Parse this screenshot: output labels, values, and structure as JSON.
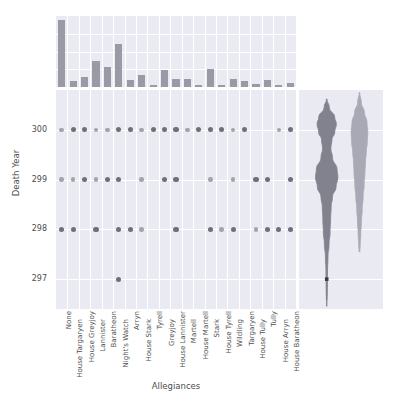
{
  "chart_data": {
    "type": "scatter",
    "title": "",
    "xlabel": "Allegiances",
    "ylabel": "Death Year",
    "grid": true,
    "legend": "none",
    "ylim": [
      296.4,
      300.8
    ],
    "yticks": [
      "300",
      "299",
      "298",
      "297"
    ],
    "ytick_values": [
      300,
      299,
      298,
      297
    ],
    "categories": [
      "None",
      "House Targaryen",
      "House Greyjoy",
      "Lannister",
      "Baratheon",
      "Night's Watch",
      "Arryn",
      "House Stark",
      "Tyrell",
      "Greyjoy",
      "House Lannister",
      "Martell",
      "House Martell",
      "Stark",
      "House Tyrell",
      "Wildling",
      "Targaryen",
      "House Tully",
      "Tully",
      "House Arryn",
      "House Baratheon"
    ],
    "marginal_bar": {
      "type": "bar",
      "ylabel": "count",
      "values": [
        66,
        6,
        10,
        26,
        20,
        42,
        7,
        12,
        2,
        17,
        8,
        8,
        2,
        18,
        2,
        8,
        6,
        3,
        7,
        2,
        4
      ],
      "ylim": [
        0,
        70
      ]
    },
    "points": [
      {
        "x": "None",
        "y": 300,
        "shade": "light"
      },
      {
        "x": "None",
        "y": 299,
        "shade": "light"
      },
      {
        "x": "None",
        "y": 298,
        "shade": "dark"
      },
      {
        "x": "House Targaryen",
        "y": 300,
        "shade": "dark"
      },
      {
        "x": "House Targaryen",
        "y": 299,
        "shade": "light"
      },
      {
        "x": "House Targaryen",
        "y": 298,
        "shade": "dark"
      },
      {
        "x": "House Greyjoy",
        "y": 300,
        "shade": "dark"
      },
      {
        "x": "House Greyjoy",
        "y": 299,
        "shade": "dark"
      },
      {
        "x": "Lannister",
        "y": 300,
        "shade": "light"
      },
      {
        "x": "Lannister",
        "y": 299,
        "shade": "light"
      },
      {
        "x": "Lannister",
        "y": 298,
        "shade": "dark"
      },
      {
        "x": "Baratheon",
        "y": 300,
        "shade": "light"
      },
      {
        "x": "Baratheon",
        "y": 299,
        "shade": "dark"
      },
      {
        "x": "Night's Watch",
        "y": 300,
        "shade": "dark"
      },
      {
        "x": "Night's Watch",
        "y": 299,
        "shade": "dark"
      },
      {
        "x": "Night's Watch",
        "y": 298,
        "shade": "dark"
      },
      {
        "x": "Night's Watch",
        "y": 297,
        "shade": "dark"
      },
      {
        "x": "Arryn",
        "y": 300,
        "shade": "dark"
      },
      {
        "x": "Arryn",
        "y": 298,
        "shade": "dark"
      },
      {
        "x": "House Stark",
        "y": 300,
        "shade": "light"
      },
      {
        "x": "House Stark",
        "y": 299,
        "shade": "light"
      },
      {
        "x": "House Stark",
        "y": 298,
        "shade": "light"
      },
      {
        "x": "Tyrell",
        "y": 300,
        "shade": "dark"
      },
      {
        "x": "Greyjoy",
        "y": 300,
        "shade": "dark"
      },
      {
        "x": "Greyjoy",
        "y": 299,
        "shade": "dark"
      },
      {
        "x": "House Lannister",
        "y": 300,
        "shade": "dark"
      },
      {
        "x": "House Lannister",
        "y": 299,
        "shade": "dark"
      },
      {
        "x": "House Lannister",
        "y": 298,
        "shade": "dark"
      },
      {
        "x": "Martell",
        "y": 300,
        "shade": "light"
      },
      {
        "x": "House Martell",
        "y": 300,
        "shade": "dark"
      },
      {
        "x": "Stark",
        "y": 300,
        "shade": "dark"
      },
      {
        "x": "Stark",
        "y": 299,
        "shade": "light"
      },
      {
        "x": "Stark",
        "y": 298,
        "shade": "dark"
      },
      {
        "x": "House Tyrell",
        "y": 300,
        "shade": "dark"
      },
      {
        "x": "House Tyrell",
        "y": 298,
        "shade": "light"
      },
      {
        "x": "Wildling",
        "y": 300,
        "shade": "light"
      },
      {
        "x": "Wildling",
        "y": 299,
        "shade": "light"
      },
      {
        "x": "Wildling",
        "y": 298,
        "shade": "dark"
      },
      {
        "x": "Targaryen",
        "y": 300,
        "shade": "dark"
      },
      {
        "x": "House Tully",
        "y": 299,
        "shade": "dark"
      },
      {
        "x": "House Tully",
        "y": 298,
        "shade": "light"
      },
      {
        "x": "Tully",
        "y": 299,
        "shade": "dark"
      },
      {
        "x": "Tully",
        "y": 298,
        "shade": "dark"
      },
      {
        "x": "House Arryn",
        "y": 300,
        "shade": "light"
      },
      {
        "x": "House Arryn",
        "y": 298,
        "shade": "dark"
      },
      {
        "x": "House Baratheon",
        "y": 300,
        "shade": "dark"
      },
      {
        "x": "House Baratheon",
        "y": 299,
        "shade": "dark"
      },
      {
        "x": "House Baratheon",
        "y": 298,
        "shade": "dark"
      }
    ],
    "marginal_violin": {
      "type": "violin",
      "series": [
        {
          "name": "dark",
          "color": "#82828f",
          "peaks_at": [
            300.15,
            299.1
          ],
          "range": [
            296.55,
            300.6
          ]
        },
        {
          "name": "light",
          "color": "#a9a9b5",
          "peaks_at": [
            299.9
          ],
          "range": [
            297.5,
            300.75
          ]
        }
      ]
    }
  },
  "colors": {
    "panel_background": "#eaeaf2",
    "grid": "#ffffff",
    "bar": "#9a9aa6",
    "dot_dark": "#6f6f7c",
    "dot_light": "#a3a3b0",
    "violin_dark": "#82828f",
    "violin_light": "#a9a9b5",
    "text": "#4d4d4d",
    "figure_background": "#ffffff"
  }
}
